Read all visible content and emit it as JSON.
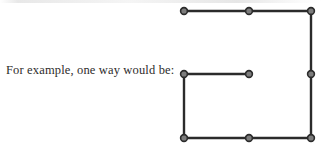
{
  "page": {
    "background_color": "#ffffff",
    "width": 321,
    "height": 146
  },
  "caption": {
    "text": "For example, one way would be:",
    "color": "#2e2c2b"
  },
  "figure": {
    "name": "dot-lattice-path-figure",
    "node_style": {
      "outline_color": "#2b2b2b",
      "fill_color": "#7c7c7c",
      "radius": 3.4
    },
    "edge_style": {
      "color": "#2b2b2b",
      "width": 2.4
    },
    "grid_x": [
      184,
      249,
      311
    ],
    "grid_y": [
      11,
      74,
      138
    ],
    "nodes": [
      {
        "id": "n-top-left",
        "label": "top-left",
        "x": 184,
        "y": 11
      },
      {
        "id": "n-top-mid",
        "label": "top-middle",
        "x": 249,
        "y": 11
      },
      {
        "id": "n-top-right",
        "label": "top-right",
        "x": 311,
        "y": 11
      },
      {
        "id": "n-mid-left",
        "label": "middle-left",
        "x": 184,
        "y": 74
      },
      {
        "id": "n-mid-mid",
        "label": "middle-center",
        "x": 249,
        "y": 74
      },
      {
        "id": "n-mid-right",
        "label": "middle-right",
        "x": 311,
        "y": 74
      },
      {
        "id": "n-bottom-left",
        "label": "bottom-left",
        "x": 184,
        "y": 138
      },
      {
        "id": "n-bottom-mid",
        "label": "bottom-middle",
        "x": 249,
        "y": 138
      },
      {
        "id": "n-bottom-right",
        "label": "bottom-right",
        "x": 311,
        "y": 138
      }
    ],
    "edges": [
      {
        "id": "e-top",
        "label": "top-horizontal-segment",
        "x1": 184,
        "y1": 11,
        "x2": 311,
        "y2": 11
      },
      {
        "id": "e-right",
        "label": "right-vertical-segment",
        "x1": 311,
        "y1": 11,
        "x2": 311,
        "y2": 138
      },
      {
        "id": "e-bottom",
        "label": "bottom-horizontal-segment",
        "x1": 311,
        "y1": 138,
        "x2": 184,
        "y2": 138
      },
      {
        "id": "e-left",
        "label": "left-vertical-segment",
        "x1": 184,
        "y1": 138,
        "x2": 184,
        "y2": 74
      },
      {
        "id": "e-middle-stub",
        "label": "middle-horizontal-stub",
        "x1": 184,
        "y1": 74,
        "x2": 249,
        "y2": 74
      }
    ]
  }
}
